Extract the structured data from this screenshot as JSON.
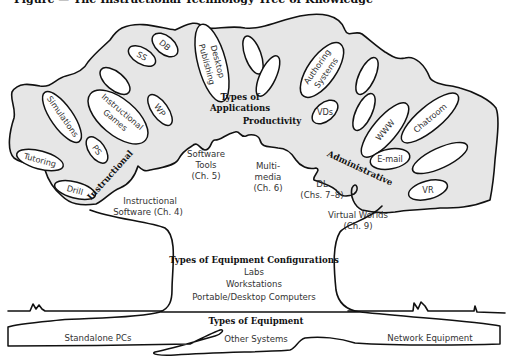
{
  "figure": {
    "title": "Figure — The Instructional Technology Tree of Knowledge"
  },
  "canopy": {
    "branch_labels": {
      "instructional": "Instructional",
      "productivity": "Productivity",
      "administrative": "Administrative",
      "applications_line1": "Types of",
      "applications_line2": "Applications"
    },
    "leaves": {
      "simulations": "Simulations",
      "instructional_games_line1": "Instructional",
      "instructional_games_line2": "Games",
      "tutoring": "Tutoring",
      "ps": "PS",
      "drill": "Drill",
      "ss": "SS",
      "db": "DB",
      "wp": "WP",
      "desktop_publishing_line1": "Desktop",
      "desktop_publishing_line2": "Publishing",
      "authoring_systems_line1": "Authoring",
      "authoring_systems_line2": "Systems",
      "vds": "VDs",
      "www": "WWW",
      "chatroom": "Chatroom",
      "email": "E-mail",
      "vr": "VR"
    },
    "chapter_labels": {
      "instructional_software_line1": "Instructional",
      "instructional_software_line2": "Software (Ch. 4)",
      "software_tools_line1": "Software",
      "software_tools_line2": "Tools",
      "software_tools_line3": "(Ch. 5)",
      "multimedia_line1": "Multi-",
      "multimedia_line2": "media",
      "multimedia_line3": "(Ch. 6)",
      "dl_line1": "DL",
      "dl_line2": "(Chs. 7–8)",
      "virtual_worlds_line1": "Virtual Worlds",
      "virtual_worlds_line2": "(Ch. 9)"
    }
  },
  "trunk": {
    "heading": "Types of Equipment Configurations",
    "items": [
      "Labs",
      "Workstations",
      "Portable/Desktop Computers"
    ]
  },
  "roots": {
    "heading": "Types of Equipment",
    "items": [
      "Standalone PCs",
      "Other Systems",
      "Network Equipment"
    ]
  }
}
